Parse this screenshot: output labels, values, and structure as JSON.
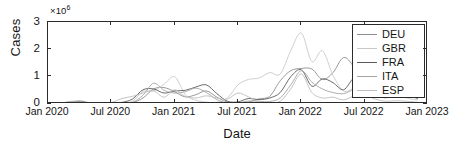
{
  "chart_data": {
    "type": "line",
    "title": "",
    "xlabel": "Date",
    "ylabel": "Cases",
    "y_exponent_label": "×10",
    "y_exponent_power": "6",
    "y_scale": 1000000,
    "ylim": [
      0,
      3000000
    ],
    "yticks": [
      0,
      1,
      2,
      3
    ],
    "ytick_labels": [
      "0",
      "1",
      "2",
      "3"
    ],
    "xlim": [
      "Jan 2020",
      "Jan 2023"
    ],
    "xtick_labels": [
      "Jan 2020",
      "Jul 2020",
      "Jan 2021",
      "Jul 2021",
      "Jan 2022",
      "Jul 2022",
      "Jan 2023"
    ],
    "grid": false,
    "legend_position": "top-right",
    "x_months": [
      "2020-01",
      "2020-02",
      "2020-03",
      "2020-04",
      "2020-05",
      "2020-06",
      "2020-07",
      "2020-08",
      "2020-09",
      "2020-10",
      "2020-11",
      "2020-12",
      "2021-01",
      "2021-02",
      "2021-03",
      "2021-04",
      "2021-05",
      "2021-06",
      "2021-07",
      "2021-08",
      "2021-09",
      "2021-10",
      "2021-11",
      "2021-12",
      "2022-01",
      "2022-02",
      "2022-03",
      "2022-04",
      "2022-05",
      "2022-06",
      "2022-07",
      "2022-08",
      "2022-09",
      "2022-10",
      "2022-11",
      "2022-12"
    ],
    "series": [
      {
        "name": "DEU",
        "color": "#8d8d8d",
        "values": [
          0.0,
          0.0,
          0.06,
          0.09,
          0.02,
          0.01,
          0.01,
          0.03,
          0.05,
          0.22,
          0.55,
          0.6,
          0.45,
          0.26,
          0.34,
          0.48,
          0.25,
          0.07,
          0.03,
          0.07,
          0.19,
          0.28,
          0.85,
          1.22,
          1.3,
          1.28,
          0.9,
          1.15,
          1.7,
          1.35,
          0.7,
          0.42,
          0.28,
          0.55,
          0.8,
          0.35
        ]
      },
      {
        "name": "GBR",
        "color": "#c9c9c9",
        "values": [
          0.0,
          0.0,
          0.03,
          0.12,
          0.05,
          0.03,
          0.02,
          0.03,
          0.1,
          0.46,
          0.48,
          0.72,
          1.0,
          0.35,
          0.14,
          0.07,
          0.06,
          0.22,
          0.7,
          0.9,
          0.95,
          1.15,
          1.1,
          1.95,
          2.6,
          1.55,
          1.95,
          1.05,
          0.48,
          0.6,
          0.9,
          0.45,
          0.3,
          0.32,
          0.22,
          0.14
        ]
      },
      {
        "name": "FRA",
        "color": "#5a5a5a",
        "values": [
          0.0,
          0.0,
          0.05,
          0.1,
          0.02,
          0.01,
          0.02,
          0.06,
          0.18,
          0.52,
          0.55,
          0.4,
          0.48,
          0.5,
          0.62,
          0.7,
          0.38,
          0.1,
          0.08,
          0.2,
          0.16,
          0.22,
          0.42,
          1.0,
          1.25,
          0.65,
          0.92,
          0.78,
          0.52,
          0.95,
          0.85,
          0.4,
          0.3,
          0.42,
          0.35,
          0.2
        ]
      },
      {
        "name": "ITA",
        "color": "#a5a5a5",
        "values": [
          0.0,
          0.01,
          0.09,
          0.1,
          0.03,
          0.01,
          0.01,
          0.02,
          0.06,
          0.32,
          0.76,
          0.5,
          0.4,
          0.45,
          0.58,
          0.42,
          0.16,
          0.04,
          0.04,
          0.11,
          0.1,
          0.09,
          0.22,
          0.7,
          1.22,
          0.8,
          0.55,
          0.42,
          0.38,
          0.55,
          0.72,
          0.42,
          0.22,
          0.45,
          0.4,
          0.18
        ]
      },
      {
        "name": "ESP",
        "color": "#bdbdbd",
        "values": [
          0.0,
          0.0,
          0.08,
          0.07,
          0.02,
          0.01,
          0.05,
          0.2,
          0.28,
          0.4,
          0.48,
          0.25,
          0.52,
          0.28,
          0.22,
          0.3,
          0.22,
          0.18,
          0.4,
          0.26,
          0.08,
          0.05,
          0.1,
          0.55,
          1.1,
          0.42,
          0.22,
          0.25,
          0.15,
          0.3,
          0.35,
          0.18,
          0.1,
          0.12,
          0.1,
          0.06
        ]
      }
    ],
    "legend_entries": [
      "DEU",
      "GBR",
      "FRA",
      "ITA",
      "ESP"
    ]
  }
}
